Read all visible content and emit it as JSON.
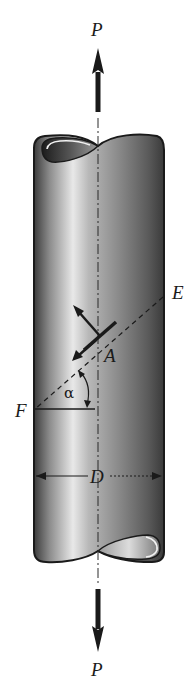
{
  "figure": {
    "labels": {
      "load_top": "P",
      "load_bottom": "P",
      "point_e": "E",
      "point_f": "F",
      "point_a": "A",
      "angle": "α",
      "diameter": "D"
    },
    "colors": {
      "background": "#ffffff",
      "ink": "#1a1a1a",
      "shaft_dark": "#3a3a3a",
      "shaft_mid": "#8a8a8a",
      "shaft_highlight": "#e6e6e6"
    }
  }
}
